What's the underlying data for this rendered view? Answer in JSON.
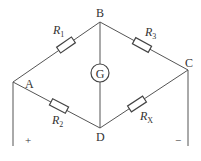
{
  "diagram": {
    "type": "wheatstone-bridge",
    "nodes": {
      "A": "A",
      "B": "B",
      "C": "C",
      "D": "D"
    },
    "galvanometer": "G",
    "resistors": {
      "r1": {
        "name": "R",
        "sub": "1"
      },
      "r3": {
        "name": "R",
        "sub": "3"
      },
      "r2": {
        "name": "R",
        "sub": "2"
      },
      "rx": {
        "name": "R",
        "sub": "X"
      }
    },
    "terminals": {
      "plus": "+",
      "minus": "−"
    },
    "line_color": "#444444"
  }
}
